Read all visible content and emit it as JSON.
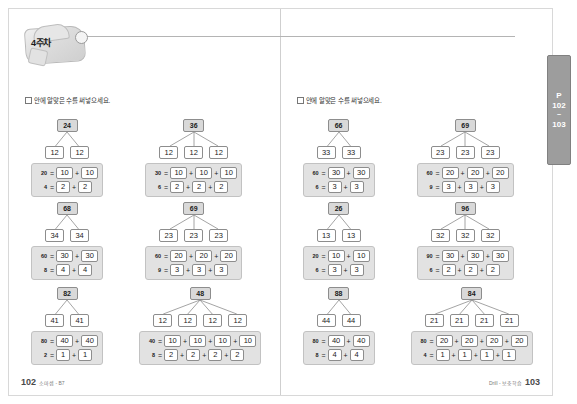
{
  "header": {
    "week_label": "4주차"
  },
  "instruction": "안에 알맞은 수를 써넣으세요.",
  "side_tab": {
    "prefix": "P",
    "page_from": "102",
    "separator": "~",
    "page_to": "103"
  },
  "footer": {
    "left_folio": "102",
    "left_note": "소마셈 - B7",
    "right_folio": "103",
    "right_note": "Drill - 보충학습"
  },
  "pages": [
    {
      "name": "left-page",
      "problems": [
        {
          "id": "p1",
          "root": "24",
          "children": [
            "12",
            "12"
          ],
          "equations": [
            {
              "lhs": "20",
              "boxes": [
                "10",
                "10"
              ]
            },
            {
              "lhs": "4",
              "boxes": [
                "2",
                "2"
              ]
            }
          ]
        },
        {
          "id": "p2",
          "root": "36",
          "children": [
            "12",
            "12",
            "12"
          ],
          "equations": [
            {
              "lhs": "30",
              "boxes": [
                "10",
                "10",
                "10"
              ]
            },
            {
              "lhs": "6",
              "boxes": [
                "2",
                "2",
                "2"
              ]
            }
          ]
        },
        {
          "id": "p3",
          "root": "68",
          "children": [
            "34",
            "34"
          ],
          "equations": [
            {
              "lhs": "60",
              "boxes": [
                "30",
                "30"
              ]
            },
            {
              "lhs": "8",
              "boxes": [
                "4",
                "4"
              ]
            }
          ]
        },
        {
          "id": "p4",
          "root": "69",
          "children": [
            "23",
            "23",
            "23"
          ],
          "equations": [
            {
              "lhs": "60",
              "boxes": [
                "20",
                "20",
                "20"
              ]
            },
            {
              "lhs": "9",
              "boxes": [
                "3",
                "3",
                "3"
              ]
            }
          ]
        },
        {
          "id": "p5",
          "root": "82",
          "children": [
            "41",
            "41"
          ],
          "equations": [
            {
              "lhs": "80",
              "boxes": [
                "40",
                "40"
              ]
            },
            {
              "lhs": "2",
              "boxes": [
                "1",
                "1"
              ]
            }
          ]
        },
        {
          "id": "p6",
          "root": "48",
          "children": [
            "12",
            "12",
            "12",
            "12"
          ],
          "equations": [
            {
              "lhs": "40",
              "boxes": [
                "10",
                "10",
                "10",
                "10"
              ]
            },
            {
              "lhs": "8",
              "boxes": [
                "2",
                "2",
                "2",
                "2"
              ]
            }
          ]
        }
      ]
    },
    {
      "name": "right-page",
      "problems": [
        {
          "id": "p7",
          "root": "66",
          "children": [
            "33",
            "33"
          ],
          "equations": [
            {
              "lhs": "60",
              "boxes": [
                "30",
                "30"
              ]
            },
            {
              "lhs": "6",
              "boxes": [
                "3",
                "3"
              ]
            }
          ]
        },
        {
          "id": "p8",
          "root": "69",
          "children": [
            "23",
            "23",
            "23"
          ],
          "equations": [
            {
              "lhs": "60",
              "boxes": [
                "20",
                "20",
                "20"
              ]
            },
            {
              "lhs": "9",
              "boxes": [
                "3",
                "3",
                "3"
              ]
            }
          ]
        },
        {
          "id": "p9",
          "root": "26",
          "children": [
            "13",
            "13"
          ],
          "equations": [
            {
              "lhs": "20",
              "boxes": [
                "10",
                "10"
              ]
            },
            {
              "lhs": "6",
              "boxes": [
                "3",
                "3"
              ]
            }
          ]
        },
        {
          "id": "p10",
          "root": "96",
          "children": [
            "32",
            "32",
            "32"
          ],
          "equations": [
            {
              "lhs": "90",
              "boxes": [
                "30",
                "30",
                "30"
              ]
            },
            {
              "lhs": "6",
              "boxes": [
                "2",
                "2",
                "2"
              ]
            }
          ]
        },
        {
          "id": "p11",
          "root": "88",
          "children": [
            "44",
            "44"
          ],
          "equations": [
            {
              "lhs": "80",
              "boxes": [
                "40",
                "40"
              ]
            },
            {
              "lhs": "8",
              "boxes": [
                "4",
                "4"
              ]
            }
          ]
        },
        {
          "id": "p12",
          "root": "84",
          "children": [
            "21",
            "21",
            "21",
            "21"
          ],
          "equations": [
            {
              "lhs": "80",
              "boxes": [
                "20",
                "20",
                "20",
                "20"
              ]
            },
            {
              "lhs": "4",
              "boxes": [
                "1",
                "1",
                "1",
                "1"
              ]
            }
          ]
        }
      ]
    }
  ],
  "layout": {
    "positions": [
      {
        "left": 22,
        "top": 110
      },
      {
        "left": 136,
        "top": 110
      },
      {
        "left": 22,
        "top": 193
      },
      {
        "left": 136,
        "top": 193
      },
      {
        "left": 22,
        "top": 278
      },
      {
        "left": 130,
        "top": 278
      }
    ],
    "instruction_top": 86
  }
}
